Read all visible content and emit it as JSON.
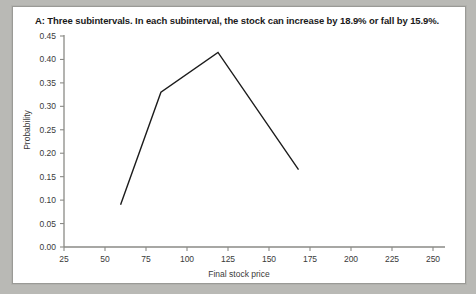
{
  "figure": {
    "title": "A: Three subintervals. In each subinterval, the stock can increase by 18.9% or fall by 15.9%.",
    "background": "#ffffff",
    "page_background": "#b9b9b5",
    "line_color": "#1c1c1c",
    "axis_color": "#8a8a86"
  },
  "chart_data": {
    "type": "line",
    "title": "A: Three subintervals. In each subinterval, the stock can increase by 18.9% or fall by 15.9%.",
    "xlabel": "Final stock price",
    "ylabel": "Probability",
    "xlim": [
      25,
      250
    ],
    "ylim": [
      0.0,
      0.45
    ],
    "xticks": [
      25,
      50,
      75,
      100,
      125,
      150,
      175,
      200,
      225,
      250
    ],
    "xtick_labels": [
      "25",
      "50",
      "75",
      "100",
      "125",
      "150",
      "175",
      "200",
      "225",
      "250"
    ],
    "yticks": [
      0.0,
      0.05,
      0.1,
      0.15,
      0.2,
      0.25,
      0.3,
      0.35,
      0.4,
      0.45
    ],
    "ytick_labels": [
      "0.00",
      "0.05",
      "0.10",
      "0.15",
      "0.20",
      "0.25",
      "0.30",
      "0.35",
      "0.40",
      "0.45"
    ],
    "grid": false,
    "legend": null,
    "series": [
      {
        "name": "Probability distribution of final stock price",
        "x": [
          59.5,
          84.1,
          118.9,
          168.0
        ],
        "y": [
          0.09,
          0.33,
          0.415,
          0.165
        ],
        "color": "#1c1c1c",
        "marker": "none",
        "linewidth": 1.4
      }
    ]
  }
}
